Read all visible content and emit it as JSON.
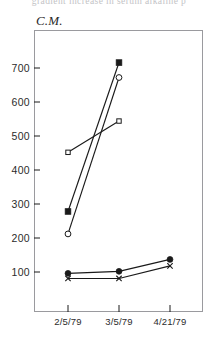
{
  "top_cut_text": "gradient increase in serum alkaline p",
  "chart_label": "C.M.",
  "axis": {
    "y_ticks": [
      100,
      200,
      300,
      400,
      500,
      600,
      700
    ],
    "y_tick_labels": [
      "100",
      "200",
      "300",
      "400",
      "500",
      "600",
      "700"
    ],
    "x_tick_labels": [
      "2/5/79",
      "3/5/79",
      "4/21/79"
    ]
  },
  "colors": {
    "line": "#1a1a1a",
    "frame": "#9a9a9e",
    "text": "#2b2b2b"
  },
  "chart_data": {
    "type": "line",
    "title": "C.M.",
    "subtitle": "",
    "xlabel": "",
    "ylabel": "",
    "categories": [
      "2/5/79",
      "3/5/79",
      "4/21/79"
    ],
    "ylim": [
      0,
      760
    ],
    "grid": false,
    "legend": "none",
    "series": [
      {
        "name": "filled-square-series",
        "marker": "filled-square",
        "x": [
          "2/5/79",
          "3/5/79"
        ],
        "values": [
          278,
          716
        ]
      },
      {
        "name": "open-circle-series",
        "marker": "open-circle",
        "x": [
          "2/5/79",
          "3/5/79"
        ],
        "values": [
          212,
          672
        ]
      },
      {
        "name": "open-square-series",
        "marker": "open-square",
        "x": [
          "2/5/79",
          "3/5/79"
        ],
        "values": [
          452,
          544
        ]
      },
      {
        "name": "filled-circle-series",
        "marker": "filled-circle",
        "x": [
          "2/5/79",
          "3/5/79",
          "4/21/79"
        ],
        "values": [
          96,
          102,
          137
        ]
      },
      {
        "name": "cross-series",
        "marker": "cross",
        "x": [
          "2/5/79",
          "3/5/79",
          "4/21/79"
        ],
        "values": [
          81,
          81,
          118
        ]
      }
    ]
  }
}
